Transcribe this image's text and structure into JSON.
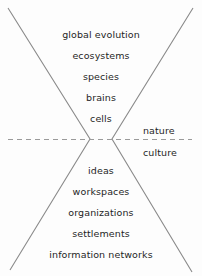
{
  "diagram": {
    "type": "bowtie-hourglass-hierarchy",
    "background_color": "#fdfdfd",
    "line_color": "#8a8a8a",
    "text_color": "#1f1f1f",
    "divider": {
      "name": "nature-culture-divider",
      "style": "dashed",
      "orientation": "horizontal"
    },
    "upper_cone": {
      "name": "nature-cone",
      "items": [
        {
          "label": "global evolution",
          "y": 30
        },
        {
          "label": "ecosystems",
          "y": 51
        },
        {
          "label": "species",
          "y": 72
        },
        {
          "label": "brains",
          "y": 93
        },
        {
          "label": "cells",
          "y": 114
        }
      ]
    },
    "lower_cone": {
      "name": "culture-cone",
      "items": [
        {
          "label": "ideas",
          "y": 166
        },
        {
          "label": "workspaces",
          "y": 187
        },
        {
          "label": "organizations",
          "y": 208
        },
        {
          "label": "settlements",
          "y": 229
        },
        {
          "label": "information networks",
          "y": 250
        }
      ]
    },
    "side_labels": [
      {
        "label": "nature",
        "x": 143,
        "y": 126
      },
      {
        "label": "culture",
        "x": 143,
        "y": 148
      }
    ]
  }
}
